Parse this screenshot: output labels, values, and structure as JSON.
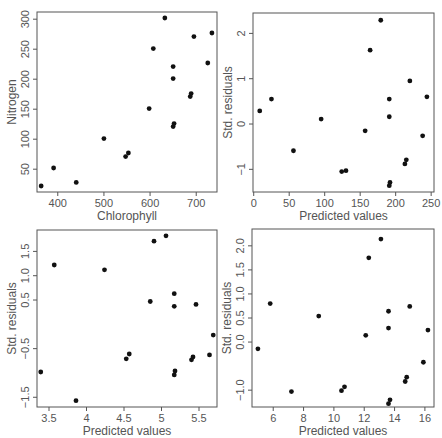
{
  "figure": {
    "width": 442,
    "height": 438,
    "layout": "2x2"
  },
  "chart_data": [
    {
      "type": "scatter",
      "title": "",
      "xlabel": "Chlorophyll",
      "ylabel": "Nitrogen",
      "xticks": [
        400,
        500,
        600,
        700
      ],
      "yticks": [
        50,
        100,
        150,
        200,
        250,
        300
      ],
      "xlim": [
        355,
        745
      ],
      "ylim": [
        12,
        312
      ],
      "box": {
        "left": 37,
        "top": 12,
        "right": 217,
        "bottom": 192
      },
      "x": [
        364,
        391,
        440,
        500,
        547,
        553,
        598,
        607,
        632,
        650,
        650,
        650,
        652,
        687,
        689,
        695,
        725,
        734
      ],
      "y": [
        22,
        52,
        28,
        101,
        71,
        77,
        151,
        251,
        302,
        221,
        201,
        121,
        126,
        171,
        176,
        271,
        227,
        277
      ]
    },
    {
      "type": "scatter",
      "title": "",
      "xlabel": "Predicted values",
      "ylabel": "Std. residuals",
      "xticks": [
        0,
        50,
        100,
        150,
        200,
        250
      ],
      "yticks": [
        -1,
        0,
        1,
        2
      ],
      "xlim": [
        -1,
        254
      ],
      "ylim": [
        -1.5,
        2.45
      ],
      "box": {
        "left": 253,
        "top": 13,
        "right": 434,
        "bottom": 192
      },
      "x": [
        8.5,
        25,
        56,
        95,
        124,
        130,
        157,
        164,
        179,
        191,
        191,
        191,
        192,
        213,
        215,
        220,
        238,
        244
      ],
      "y": [
        0.29,
        0.55,
        -0.59,
        0.11,
        -1.05,
        -1.03,
        -0.15,
        1.63,
        2.29,
        0.55,
        0.16,
        -1.36,
        -1.29,
        -0.88,
        -0.79,
        0.95,
        -0.26,
        0.6
      ]
    },
    {
      "type": "scatter",
      "title": "",
      "xlabel": "Predicted values",
      "ylabel": "Std. residuals",
      "xticks": [
        3.5,
        4.0,
        4.5,
        5.0,
        5.5
      ],
      "yticks": [
        -1.5,
        -0.5,
        0.5,
        1.0,
        1.5
      ],
      "ytick_labels": [
        "-1.5",
        "-0.5",
        "0.5",
        "1.0",
        "1.5"
      ],
      "xlim": [
        3.34,
        5.74
      ],
      "ylim": [
        -1.7,
        1.94
      ],
      "box": {
        "left": 37,
        "top": 230,
        "right": 217,
        "bottom": 407
      },
      "x": [
        3.39,
        3.57,
        3.86,
        4.24,
        4.53,
        4.57,
        4.85,
        4.9,
        5.06,
        5.17,
        5.17,
        5.17,
        5.18,
        5.4,
        5.42,
        5.46,
        5.64,
        5.69
      ],
      "y": [
        -0.98,
        1.22,
        -1.57,
        1.12,
        -0.71,
        -0.61,
        0.47,
        1.71,
        1.82,
        0.63,
        0.37,
        -1.04,
        -0.96,
        -0.73,
        -0.67,
        0.41,
        -0.63,
        -0.22
      ]
    },
    {
      "type": "scatter",
      "title": "",
      "xlabel": "Predicted values",
      "ylabel": "Std. residuals",
      "xticks": [
        6,
        8,
        10,
        12,
        14,
        16
      ],
      "yticks": [
        -1.0,
        0.0,
        0.5,
        1.0,
        1.5,
        2.0
      ],
      "ytick_labels": [
        "-1.0",
        "0.0",
        "0.5",
        "1.0",
        "1.5",
        "2.0"
      ],
      "xlim": [
        4.6,
        16.6
      ],
      "ylim": [
        -1.35,
        2.35
      ],
      "box": {
        "left": 252,
        "top": 229,
        "right": 434,
        "bottom": 407
      },
      "x": [
        4.99,
        5.8,
        7.2,
        9.0,
        10.5,
        10.7,
        12.1,
        12.3,
        13.1,
        13.6,
        13.6,
        13.6,
        13.7,
        14.7,
        14.8,
        15.0,
        15.9,
        16.2
      ],
      "y": [
        -0.14,
        0.8,
        -1.03,
        0.54,
        -1.01,
        -0.93,
        0.14,
        1.75,
        2.14,
        0.64,
        0.29,
        -1.28,
        -1.2,
        -0.82,
        -0.73,
        0.74,
        -0.42,
        0.25
      ]
    }
  ]
}
